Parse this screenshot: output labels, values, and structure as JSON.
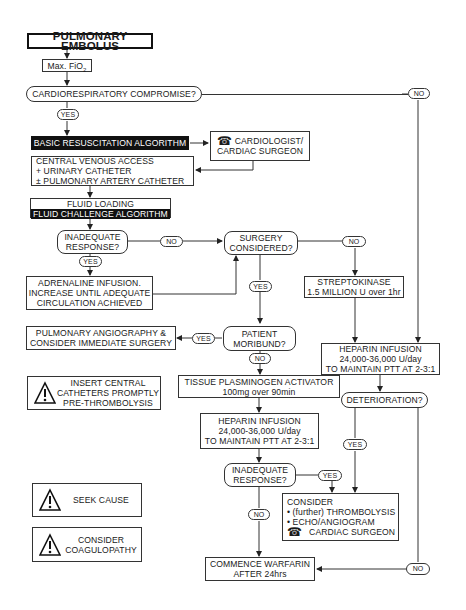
{
  "title": "PULMONARY EMBOLUS",
  "nodes": {
    "max_fio2": {
      "text": "Max. FiO",
      "sub": "2"
    },
    "cardio_compromise": "CARDIORESPIRATORY COMPROMISE?",
    "basic_resus": "BASIC RESUSCITATION ALGORITHM",
    "cardiologist": {
      "line1": "CARDIOLOGIST/",
      "line2": "CARDIAC SURGEON"
    },
    "central_venous": {
      "line1": "CENTRAL VENOUS ACCESS",
      "line2": "+ URINARY CATHETER",
      "line3": "± PULMONARY ARTERY CATHETER"
    },
    "fluid_loading": "FLUID LOADING",
    "fluid_challenge": "FLUID CHALLENGE ALGORITHM",
    "inadequate_1": {
      "line1": "INADEQUATE",
      "line2": "RESPONSE?"
    },
    "adrenaline": {
      "line1": "ADRENALINE INFUSION.",
      "line2": "INCREASE UNTIL ADEQUATE",
      "line3": "CIRCULATION ACHIEVED"
    },
    "surgery_considered": {
      "line1": "SURGERY",
      "line2": "CONSIDERED?"
    },
    "streptokinase": {
      "line1": "STREPTOKINASE",
      "line2": "1.5 MILLION U over 1hr"
    },
    "angiography": {
      "line1": "PULMONARY ANGIOGRAPHY &",
      "line2": "CONSIDER IMMEDIATE SURGERY"
    },
    "patient_moribund": {
      "line1": "PATIENT",
      "line2": "MORIBUND?"
    },
    "heparin_right": {
      "line1": "HEPARIN INFUSION",
      "line2": "24,000-36,000 U/day",
      "line3": "TO MAINTAIN PTT AT 2-3:1"
    },
    "insert_central": {
      "line1": "INSERT CENTRAL",
      "line2": "CATHETERS PROMPTLY",
      "line3": "PRE-THROMBOLYSIS"
    },
    "tpa": {
      "line1": "TISSUE PLASMINOGEN ACTIVATOR",
      "line2": "100mg over 90min"
    },
    "deterioration": "DETERIORATION?",
    "heparin_center": {
      "line1": "HEPARIN INFUSION",
      "line2": "24,000-36,000 U/day",
      "line3": "TO MAINTAIN PTT AT 2-3:1"
    },
    "inadequate_2": {
      "line1": "INADEQUATE",
      "line2": "RESPONSE?"
    },
    "seek_cause": "SEEK CAUSE",
    "consider_box": {
      "line1": "CONSIDER",
      "line2": "• (further) THROMBOLYSIS",
      "line3": "• ECHO/ANGIOGRAM",
      "line4": "CARDIAC SURGEON"
    },
    "coagulopathy": {
      "line1": "CONSIDER",
      "line2": "COAGULOPATHY"
    },
    "warfarin": {
      "line1": "COMMENCE WARFARIN",
      "line2": "AFTER 24hrs"
    }
  },
  "labels": {
    "yes": "YES",
    "no": "NO"
  },
  "icons": {
    "phone": "☎",
    "warning": "warning-triangle-icon"
  }
}
